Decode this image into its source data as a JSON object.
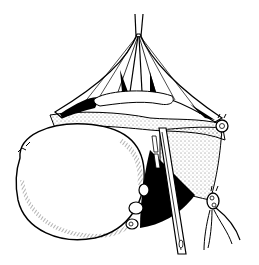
{
  "illustration": {
    "subject": "surgical line illustration",
    "colors": {
      "ink": "#000000",
      "paper": "#ffffff"
    },
    "elements": [
      "retracted-tissue-tent",
      "suture-threads-top",
      "large-oval-mass",
      "vertical-clamp-instrument",
      "ring-clips-left",
      "ring-clip-right-upper",
      "ring-clip-right-lower",
      "vessel-bundle-right"
    ]
  }
}
